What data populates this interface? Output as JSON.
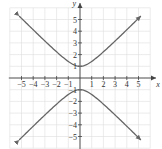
{
  "chart_data": {
    "type": "line",
    "title": "",
    "xlabel": "x",
    "ylabel": "y",
    "xlim": [
      -6,
      6
    ],
    "ylim": [
      -6,
      6
    ],
    "grid": true,
    "legend": null,
    "x_ticks": [
      -5,
      -4,
      -3,
      -2,
      -1,
      1,
      2,
      3,
      4,
      5
    ],
    "y_ticks": [
      -5,
      -4,
      -3,
      -2,
      -1,
      1,
      2,
      3,
      4,
      5
    ],
    "x_tick_labels": [
      "−5",
      "−4",
      "−3",
      "−2",
      "−1",
      "1",
      "2",
      "3",
      "4",
      "5"
    ],
    "y_tick_labels": [
      "−5",
      "−4",
      "−3",
      "−2",
      "−1",
      "1",
      "2",
      "3",
      "4",
      "5"
    ],
    "series": [
      {
        "name": "upper branch",
        "equation": "y = sqrt(1 + x^2)",
        "x": [
          -5,
          -4,
          -3,
          -2,
          -1,
          0,
          1,
          2,
          3,
          4,
          5
        ],
        "y": [
          5.1,
          4.12,
          3.16,
          2.24,
          1.41,
          1,
          1.41,
          2.24,
          3.16,
          4.12,
          5.1
        ],
        "arrows": "both ends"
      },
      {
        "name": "lower branch",
        "equation": "y = -sqrt(1 + x^2)",
        "x": [
          -5,
          -4,
          -3,
          -2,
          -1,
          0,
          1,
          2,
          3,
          4,
          5
        ],
        "y": [
          -5.1,
          -4.12,
          -3.16,
          -2.24,
          -1.41,
          -1,
          -1.41,
          -2.24,
          -3.16,
          -4.12,
          -5.1
        ],
        "arrows": "both ends"
      }
    ],
    "curve_color": "#666666",
    "axis_color": "#444444",
    "grid_color": "#dddddd"
  }
}
